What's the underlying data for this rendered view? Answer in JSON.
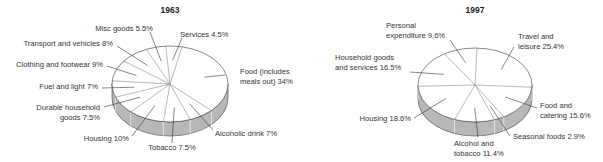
{
  "chart_data": [
    {
      "type": "pie",
      "title": "1963",
      "categories": [
        "Food (includes meals out)",
        "Alcoholic drink",
        "Tobacco",
        "Housing",
        "Durable household goods",
        "Fuel and light",
        "Clothing and footwear",
        "Transport and vehicles",
        "Misc goods",
        "Services"
      ],
      "values": [
        34,
        7,
        7.5,
        10,
        7.5,
        7,
        9,
        8,
        5.5,
        4.5
      ],
      "unit": "%",
      "style": "3d-exploded-none",
      "labels": [
        {
          "lines": [
            "Food (includes",
            "meals out) 34%"
          ]
        },
        {
          "lines": [
            "Alcoholic drink 7%"
          ]
        },
        {
          "lines": [
            "Tobacco 7.5%"
          ]
        },
        {
          "lines": [
            "Housing 10%"
          ]
        },
        {
          "lines": [
            "Durable household",
            "goods 7.5%"
          ]
        },
        {
          "lines": [
            "Fuel and light 7%"
          ]
        },
        {
          "lines": [
            "Clothing and footwear 9%"
          ]
        },
        {
          "lines": [
            "Transport and vehicles 8%"
          ]
        },
        {
          "lines": [
            "Misc goods 5.5%"
          ]
        },
        {
          "lines": [
            "Services 4.5%"
          ]
        }
      ]
    },
    {
      "type": "pie",
      "title": "1997",
      "categories": [
        "Travel and leisure",
        "Food and catering",
        "Seasonal foods",
        "Alcohol and tobacco",
        "Housing",
        "Household goods and services",
        "Personal expenditure"
      ],
      "values": [
        25.4,
        15.6,
        2.9,
        11.4,
        18.6,
        16.5,
        9.6
      ],
      "unit": "%",
      "labels": [
        {
          "lines": [
            "Travel and",
            "leisure 25.4%"
          ]
        },
        {
          "lines": [
            "Food and",
            "catering 15.6%"
          ]
        },
        {
          "lines": [
            "Seasonal foods 2.9%"
          ]
        },
        {
          "lines": [
            "Alcohol and",
            "tobacco 11.4%"
          ]
        },
        {
          "lines": [
            "Housing 18.6%"
          ]
        },
        {
          "lines": [
            "Household goods",
            "and services 16.5%"
          ]
        },
        {
          "lines": [
            "Personal",
            "expenditure 9.6%"
          ]
        }
      ]
    }
  ],
  "colors": {
    "top": "#ffffff",
    "side": "#b8b8b8",
    "line": "#555555",
    "leader": "#333333"
  }
}
